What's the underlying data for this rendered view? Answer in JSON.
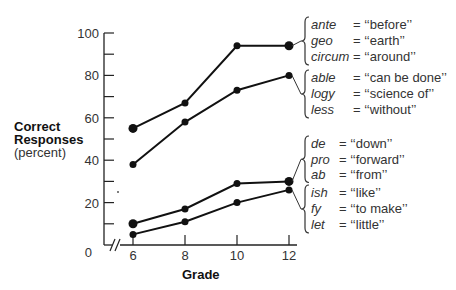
{
  "chart_data": {
    "type": "line",
    "title": "",
    "xlabel": "Grade",
    "ylabel": "Correct Responses",
    "ylabel_sub": "(percent)",
    "x": [
      6,
      8,
      10,
      12
    ],
    "x_tick_labels": [
      "6",
      "8",
      "10",
      "12"
    ],
    "y_tick_labels": [
      "0",
      "20",
      "40",
      "60",
      "80",
      "100"
    ],
    "ylim": [
      0,
      100
    ],
    "grid": false,
    "legend_position": "right (brace annotations)",
    "series": [
      {
        "name": "ante/geo/circum",
        "values": [
          55,
          67,
          94,
          94
        ],
        "annotations": [
          {
            "word": "ante",
            "meaning": "= ‘‘before’’"
          },
          {
            "word": "geo",
            "meaning": "= ‘‘earth’’"
          },
          {
            "word": "circum",
            "meaning": "= ‘‘around’’"
          }
        ]
      },
      {
        "name": "able/logy/less",
        "values": [
          38,
          58,
          73,
          80
        ],
        "annotations": [
          {
            "word": "able",
            "meaning": "= ‘‘can be done’’"
          },
          {
            "word": "logy",
            "meaning": "= ‘‘science of’’"
          },
          {
            "word": "less",
            "meaning": "= ‘‘without’’"
          }
        ]
      },
      {
        "name": "de/pro/ab",
        "values": [
          10,
          17,
          29,
          30
        ],
        "annotations": [
          {
            "word": "de",
            "meaning": "= ‘‘down’’"
          },
          {
            "word": "pro",
            "meaning": "= ‘‘forward’’"
          },
          {
            "word": "ab",
            "meaning": "= ‘‘from’’"
          }
        ]
      },
      {
        "name": "ish/fy/let",
        "values": [
          5,
          11,
          20,
          26
        ],
        "annotations": [
          {
            "word": "ish",
            "meaning": "= ‘‘like’’"
          },
          {
            "word": "fy",
            "meaning": "= ‘‘to make’’"
          },
          {
            "word": "let",
            "meaning": "= ‘‘little’’"
          }
        ]
      }
    ]
  }
}
